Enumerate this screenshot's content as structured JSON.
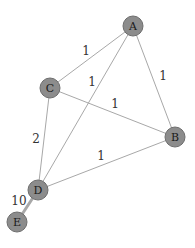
{
  "graph": {
    "nodes": [
      {
        "id": "A",
        "label": "A",
        "x": 133,
        "y": 26
      },
      {
        "id": "B",
        "label": "B",
        "x": 175,
        "y": 137
      },
      {
        "id": "C",
        "label": "C",
        "x": 50,
        "y": 88
      },
      {
        "id": "D",
        "label": "D",
        "x": 38,
        "y": 190
      },
      {
        "id": "E",
        "label": "E",
        "x": 17,
        "y": 222
      }
    ],
    "edges": [
      {
        "from": "A",
        "to": "C",
        "weight": "1",
        "label_x": 86,
        "label_y": 51
      },
      {
        "from": "A",
        "to": "D",
        "weight": "1",
        "label_x": 92,
        "label_y": 82
      },
      {
        "from": "A",
        "to": "B",
        "weight": "1",
        "label_x": 163,
        "label_y": 76
      },
      {
        "from": "C",
        "to": "B",
        "weight": "1",
        "label_x": 115,
        "label_y": 104
      },
      {
        "from": "C",
        "to": "D",
        "weight": "2",
        "label_x": 36,
        "label_y": 139
      },
      {
        "from": "D",
        "to": "B",
        "weight": "1",
        "label_x": 101,
        "label_y": 156
      },
      {
        "from": "D",
        "to": "E",
        "weight": "10",
        "label_x": 19,
        "label_y": 201
      }
    ]
  },
  "colors": {
    "node_fill": "#8c8c8c",
    "node_stroke": "#6e6e6e",
    "edge": "#a8a8a8"
  }
}
